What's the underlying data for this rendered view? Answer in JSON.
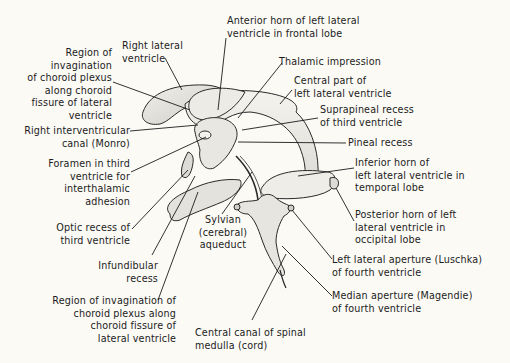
{
  "figure": {
    "background_color": "#fbfaf5",
    "line_color": "#1c1c1c",
    "labels": [
      {
        "id": "anterior-horn",
        "text": "Anterior horn of left lateral\nventricle in frontal lobe"
      },
      {
        "id": "right-lateral-ventricle",
        "text": "Right lateral\nventricle"
      },
      {
        "id": "region-invagination-upper",
        "text": "Region of\ninvagination\nof choroid plexus\nalong choroid\nfissure of lateral\nventricle"
      },
      {
        "id": "thalamic-impression",
        "text": "Thalamic impression"
      },
      {
        "id": "central-part",
        "text": "Central part of\nleft lateral ventricle"
      },
      {
        "id": "suprapineal-recess",
        "text": "Suprapineal recess\nof third ventricle"
      },
      {
        "id": "right-interventricular-canal",
        "text": "Right interventricular\ncanal (Monro)"
      },
      {
        "id": "pineal-recess",
        "text": "Pineal recess"
      },
      {
        "id": "foramen-third-ventricle",
        "text": "Foramen in third\nventricle for\ninterthalamic\nadhesion"
      },
      {
        "id": "inferior-horn",
        "text": "Inferior horn of\nleft lateral ventricle in\ntemporal lobe"
      },
      {
        "id": "optic-recess",
        "text": "Optic recess of\nthird ventricle"
      },
      {
        "id": "sylvian-aqueduct",
        "text": "Sylvian\n(cerebral)\naqueduct"
      },
      {
        "id": "posterior-horn",
        "text": "Posterior horn of left\nlateral ventricle in\noccipital lobe"
      },
      {
        "id": "infundibular-recess",
        "text": "Infundibular\nrecess"
      },
      {
        "id": "left-lateral-aperture",
        "text": "Left lateral aperture (Luschka)\nof fourth ventricle"
      },
      {
        "id": "region-invagination-lower",
        "text": "Region of invagination of\nchoroid plexus along\nchoroid fissure of\nlateral ventricle"
      },
      {
        "id": "median-aperture",
        "text": "Median aperture (Magendie)\nof fourth ventricle"
      },
      {
        "id": "central-canal",
        "text": "Central canal of spinal\nmedulla (cord)"
      }
    ],
    "caption": ""
  }
}
